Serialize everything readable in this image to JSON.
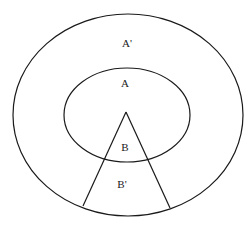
{
  "diagram": {
    "type": "nested-ellipses-with-wedge",
    "labels": {
      "outer_region": "A'",
      "inner_region": "A",
      "wedge_inner": "B",
      "wedge_outer": "B'"
    },
    "stroke_color": "#1a1a1a",
    "background_color": "#ffffff"
  }
}
